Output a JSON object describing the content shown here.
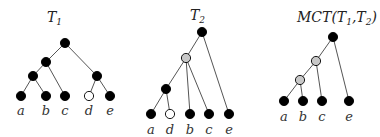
{
  "trees": [
    {
      "title": "T",
      "title_sub": "1",
      "title_pos": [
        47,
        22
      ],
      "nodes": [
        {
          "id": "r",
          "x": 65,
          "y": 43,
          "fill": "black"
        },
        {
          "id": "n1",
          "x": 46,
          "y": 62,
          "fill": "black"
        },
        {
          "id": "n2",
          "x": 33,
          "y": 76,
          "fill": "black"
        },
        {
          "id": "n3",
          "x": 97,
          "y": 76,
          "fill": "black"
        },
        {
          "id": "a",
          "x": 21,
          "y": 96,
          "fill": "black",
          "label": "a"
        },
        {
          "id": "b",
          "x": 46,
          "y": 96,
          "fill": "black",
          "label": "b"
        },
        {
          "id": "c",
          "x": 65,
          "y": 96,
          "fill": "black",
          "label": "c"
        },
        {
          "id": "d",
          "x": 89,
          "y": 96,
          "fill": "white",
          "label": "d"
        },
        {
          "id": "e",
          "x": 110,
          "y": 96,
          "fill": "black",
          "label": "e"
        }
      ],
      "edges": [
        [
          "r",
          "n1"
        ],
        [
          "r",
          "n3"
        ],
        [
          "n1",
          "n2"
        ],
        [
          "n1",
          "c"
        ],
        [
          "n2",
          "a"
        ],
        [
          "n2",
          "b"
        ],
        [
          "n3",
          "d"
        ],
        [
          "n3",
          "e"
        ]
      ],
      "label_y": 115
    },
    {
      "title": "T",
      "title_sub": "2",
      "title_pos": [
        190,
        20
      ],
      "nodes": [
        {
          "id": "r",
          "x": 202,
          "y": 32,
          "fill": "black"
        },
        {
          "id": "g",
          "x": 186,
          "y": 58,
          "fill": "gray"
        },
        {
          "id": "n",
          "x": 166,
          "y": 89,
          "fill": "black"
        },
        {
          "id": "a",
          "x": 151,
          "y": 114,
          "fill": "black",
          "label": "a"
        },
        {
          "id": "d",
          "x": 170,
          "y": 114,
          "fill": "white",
          "label": "d"
        },
        {
          "id": "b",
          "x": 190,
          "y": 114,
          "fill": "black",
          "label": "b"
        },
        {
          "id": "c",
          "x": 209,
          "y": 114,
          "fill": "black",
          "label": "c"
        },
        {
          "id": "e",
          "x": 229,
          "y": 114,
          "fill": "black",
          "label": "e"
        }
      ],
      "edges": [
        [
          "r",
          "g"
        ],
        [
          "r",
          "e"
        ],
        [
          "g",
          "n"
        ],
        [
          "g",
          "b"
        ],
        [
          "g",
          "c"
        ],
        [
          "n",
          "a"
        ],
        [
          "n",
          "d"
        ]
      ],
      "label_y": 134
    },
    {
      "title": "MCT(T",
      "title_sub": "1",
      "title_mid": ",T",
      "title_sub2": "2",
      "title_close": ")",
      "title_pos": [
        297,
        22
      ],
      "nodes": [
        {
          "id": "r",
          "x": 333,
          "y": 37,
          "fill": "black"
        },
        {
          "id": "g1",
          "x": 316,
          "y": 61,
          "fill": "gray"
        },
        {
          "id": "g2",
          "x": 300,
          "y": 80,
          "fill": "gray"
        },
        {
          "id": "a",
          "x": 284,
          "y": 101,
          "fill": "black",
          "label": "a"
        },
        {
          "id": "b",
          "x": 303,
          "y": 101,
          "fill": "black",
          "label": "b"
        },
        {
          "id": "c",
          "x": 322,
          "y": 101,
          "fill": "black",
          "label": "c"
        },
        {
          "id": "e",
          "x": 349,
          "y": 101,
          "fill": "black",
          "label": "e"
        }
      ],
      "edges": [
        [
          "r",
          "g1"
        ],
        [
          "r",
          "e"
        ],
        [
          "g1",
          "g2"
        ],
        [
          "g1",
          "c"
        ],
        [
          "g2",
          "a"
        ],
        [
          "g2",
          "b"
        ]
      ],
      "label_y": 121
    }
  ],
  "colors": {
    "black": "#000000",
    "white": "#ffffff",
    "gray": "#c8c8c8",
    "stroke": "#000000",
    "edge": "#555555"
  }
}
